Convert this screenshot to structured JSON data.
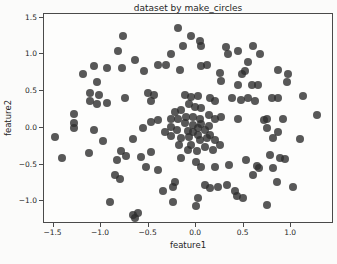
{
  "figure": {
    "background": "#fbfbfa",
    "frame_color": "#4a4a4a"
  },
  "chart_data": {
    "type": "scatter",
    "title": "dataset by make_circles",
    "xlabel": "feature1",
    "ylabel": "feature2",
    "xlim": [
      -1.6,
      1.45
    ],
    "ylim": [
      -1.31,
      1.55
    ],
    "grid": false,
    "legend": "none",
    "marker_color": "#2e2e2e",
    "marker_opacity": 0.8,
    "x_ticks": [
      {
        "value": -1.5,
        "label": "−1.5"
      },
      {
        "value": -1.0,
        "label": "−1.0"
      },
      {
        "value": -0.5,
        "label": "−0.5"
      },
      {
        "value": 0.0,
        "label": "0.0"
      },
      {
        "value": 0.5,
        "label": "0.5"
      },
      {
        "value": 1.0,
        "label": "1.0"
      }
    ],
    "y_ticks": [
      {
        "value": 1.5,
        "label": "1.5"
      },
      {
        "value": 1.0,
        "label": "1.0"
      },
      {
        "value": 0.5,
        "label": "0.5"
      },
      {
        "value": 0.0,
        "label": "0.0"
      },
      {
        "value": -0.5,
        "label": "−0.5"
      },
      {
        "value": -1.0,
        "label": "−1.0"
      }
    ],
    "points": [
      [
        -0.77,
        1.25
      ],
      [
        -0.82,
        1.05
      ],
      [
        -0.64,
        0.92
      ],
      [
        -1.07,
        0.84
      ],
      [
        -0.94,
        0.81
      ],
      [
        -0.78,
        0.82
      ],
      [
        -1.19,
        0.73
      ],
      [
        -1.04,
        0.62
      ],
      [
        -1.12,
        0.47
      ],
      [
        -1.02,
        0.45
      ],
      [
        -0.75,
        0.4
      ],
      [
        -1.12,
        0.36
      ],
      [
        -1.04,
        0.33
      ],
      [
        -0.94,
        0.34
      ],
      [
        -1.28,
        0.19
      ],
      [
        -1.28,
        0.06
      ],
      [
        -0.19,
        1.36
      ],
      [
        -0.05,
        1.25
      ],
      [
        0.04,
        1.18
      ],
      [
        0.05,
        1.11
      ],
      [
        -0.14,
        1.12
      ],
      [
        0.31,
        1.1
      ],
      [
        -0.26,
        1.0
      ],
      [
        0.33,
        1.01
      ],
      [
        -0.4,
        0.86
      ],
      [
        -0.32,
        0.86
      ],
      [
        -0.55,
        0.78
      ],
      [
        -0.17,
        0.79
      ],
      [
        0.05,
        0.84
      ],
      [
        0.11,
        0.86
      ],
      [
        0.25,
        0.75
      ],
      [
        0.26,
        0.64
      ],
      [
        -0.51,
        0.47
      ],
      [
        -0.44,
        0.45
      ],
      [
        -0.47,
        0.37
      ],
      [
        -0.12,
        0.45
      ],
      [
        -0.05,
        0.42
      ],
      [
        0.02,
        0.44
      ],
      [
        0.15,
        0.4
      ],
      [
        0.2,
        0.37
      ],
      [
        -0.08,
        0.32
      ],
      [
        -0.01,
        0.29
      ],
      [
        0.05,
        0.27
      ],
      [
        -0.16,
        0.25
      ],
      [
        -0.22,
        0.22
      ],
      [
        -0.27,
        0.12
      ],
      [
        -0.19,
        0.12
      ],
      [
        -0.11,
        0.15
      ],
      [
        -0.03,
        0.15
      ],
      [
        0.04,
        0.12
      ],
      [
        0.13,
        0.18
      ],
      [
        0.2,
        0.12
      ],
      [
        0.26,
        0.15
      ],
      [
        -0.4,
        0.11
      ],
      [
        -0.48,
        0.08
      ],
      [
        0.38,
        0.4
      ],
      [
        0.6,
        1.11
      ],
      [
        0.67,
        1.0
      ],
      [
        0.55,
        0.9
      ],
      [
        0.44,
        1.05
      ],
      [
        0.51,
        0.77
      ],
      [
        0.48,
        0.73
      ],
      [
        0.86,
        0.79
      ],
      [
        0.97,
        0.73
      ],
      [
        0.44,
        0.59
      ],
      [
        0.59,
        0.59
      ],
      [
        0.65,
        0.58
      ],
      [
        0.96,
        0.63
      ],
      [
        0.8,
        0.4
      ],
      [
        0.86,
        0.41
      ],
      [
        0.47,
        0.38
      ],
      [
        0.55,
        0.4
      ],
      [
        0.62,
        0.36
      ],
      [
        1.12,
        0.44
      ],
      [
        0.44,
        0.12
      ],
      [
        0.71,
        0.11
      ],
      [
        0.75,
        0.12
      ],
      [
        0.91,
        0.12
      ],
      [
        1.27,
        0.18
      ],
      [
        -1.49,
        -0.12
      ],
      [
        -1.29,
        0.0
      ],
      [
        -1.07,
        -0.03
      ],
      [
        -0.98,
        -0.18
      ],
      [
        -0.66,
        -0.15
      ],
      [
        -1.41,
        -0.41
      ],
      [
        -1.13,
        -0.34
      ],
      [
        -0.79,
        -0.32
      ],
      [
        -0.74,
        -0.38
      ],
      [
        -0.83,
        -0.44
      ],
      [
        -0.85,
        -0.64
      ],
      [
        -0.8,
        -0.7
      ],
      [
        -0.91,
        -1.01
      ],
      [
        -0.66,
        -1.18
      ],
      [
        -0.64,
        -1.23
      ],
      [
        -0.56,
        0.0
      ],
      [
        -0.33,
        -0.05
      ],
      [
        -0.27,
        0.01
      ],
      [
        -0.16,
        -0.14
      ],
      [
        -0.08,
        -0.12
      ],
      [
        -0.03,
        -0.05
      ],
      [
        0.02,
        0.0
      ],
      [
        0.09,
        -0.03
      ],
      [
        0.15,
        -0.1
      ],
      [
        0.2,
        -0.16
      ],
      [
        0.04,
        -0.16
      ],
      [
        -0.05,
        -0.23
      ],
      [
        0.09,
        -0.26
      ],
      [
        0.18,
        -0.3
      ],
      [
        0.25,
        -0.23
      ],
      [
        -0.47,
        -0.33
      ],
      [
        -0.58,
        -0.4
      ],
      [
        -0.53,
        -0.53
      ],
      [
        -0.4,
        -0.58
      ],
      [
        -0.16,
        -0.41
      ],
      [
        0.0,
        -0.47
      ],
      [
        0.05,
        -0.53
      ],
      [
        0.2,
        -0.53
      ],
      [
        0.34,
        -0.51
      ],
      [
        -0.22,
        -0.74
      ],
      [
        -0.24,
        -0.81
      ],
      [
        -0.35,
        -0.86
      ],
      [
        0.09,
        -0.78
      ],
      [
        0.15,
        -0.82
      ],
      [
        0.23,
        -0.81
      ],
      [
        0.32,
        -0.78
      ],
      [
        0.02,
        -0.95
      ],
      [
        -0.24,
        -1.01
      ],
      [
        0.0,
        -1.07
      ],
      [
        -0.61,
        -1.16
      ],
      [
        0.75,
        0.0
      ],
      [
        0.86,
        -0.05
      ],
      [
        0.81,
        -0.14
      ],
      [
        1.09,
        -0.15
      ],
      [
        0.78,
        -0.37
      ],
      [
        0.88,
        -0.41
      ],
      [
        0.93,
        -0.42
      ],
      [
        0.52,
        -0.44
      ],
      [
        0.64,
        -0.52
      ],
      [
        0.66,
        -0.55
      ],
      [
        0.81,
        -0.55
      ],
      [
        0.6,
        -0.64
      ],
      [
        0.85,
        -0.74
      ],
      [
        1.02,
        -0.81
      ],
      [
        0.41,
        -0.86
      ],
      [
        0.49,
        -0.95
      ],
      [
        0.43,
        -0.93
      ],
      [
        0.75,
        -1.05
      ],
      [
        -0.12,
        0.07
      ],
      [
        -0.03,
        0.04
      ],
      [
        0.05,
        0.05
      ],
      [
        0.13,
        0.03
      ],
      [
        -0.2,
        -0.03
      ],
      [
        -0.09,
        -0.04
      ],
      [
        0.02,
        -0.1
      ],
      [
        0.11,
        -0.14
      ],
      [
        -0.26,
        -0.11
      ],
      [
        -0.18,
        -0.23
      ],
      [
        -0.09,
        -0.3
      ],
      [
        0.01,
        -0.32
      ]
    ]
  }
}
